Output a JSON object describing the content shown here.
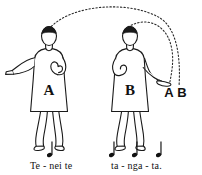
{
  "illustration": {
    "title": "Two figures performing a gesture with motion arcs",
    "background_color": "#ffffff",
    "ink_color": "#1a1a1a"
  },
  "figures": [
    {
      "id": "figure-a",
      "body_label": "A",
      "position": "left",
      "arm_pose": "left arm extended horizontally outward, right hand raised to chest"
    },
    {
      "id": "figure-b",
      "body_label": "B",
      "position": "right",
      "arm_pose": "right arm extended downward to the side, left hand at chest"
    }
  ],
  "arcs": [
    {
      "id": "arc-from-a",
      "style": "dotted",
      "from": "figure-a head",
      "to": "label A"
    },
    {
      "id": "arc-from-b",
      "style": "dotted",
      "from": "figure-b head",
      "to": "label B"
    }
  ],
  "endpoint_labels": {
    "label_a": "A",
    "label_b": "B"
  },
  "notation": {
    "phrase_1": {
      "lyrics": "Te - nei  te",
      "note_count": 1,
      "note_type": "quarter-note"
    },
    "phrase_2": {
      "lyrics": "ta - nga - ta.",
      "note_count": 3,
      "note_type": "quarter-note"
    }
  }
}
